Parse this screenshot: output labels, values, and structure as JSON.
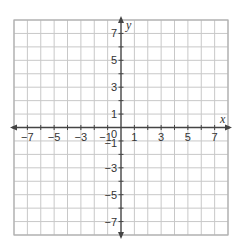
{
  "chart_data": {
    "type": "scatter",
    "title": "",
    "xlabel": "x",
    "ylabel": "y",
    "xlim": [
      -8,
      8
    ],
    "ylim": [
      -8,
      8
    ],
    "grid": true,
    "grid_step": 1,
    "x_tick_labels": [
      "−7",
      "−5",
      "−3",
      "−1",
      "1",
      "3",
      "5",
      "7"
    ],
    "x_tick_values": [
      -7,
      -5,
      -3,
      -1,
      1,
      3,
      5,
      7
    ],
    "y_tick_labels": [
      "7",
      "5",
      "3",
      "1",
      "−1",
      "−3",
      "−5",
      "−7"
    ],
    "y_tick_values": [
      7,
      5,
      3,
      1,
      -1,
      -3,
      -5,
      -7
    ],
    "origin_label": "0",
    "series": [],
    "legend": null
  },
  "colors": {
    "grid": "#c8c8c8",
    "border": "#b0b0b0",
    "axis": "#444444",
    "text": "#333333"
  }
}
